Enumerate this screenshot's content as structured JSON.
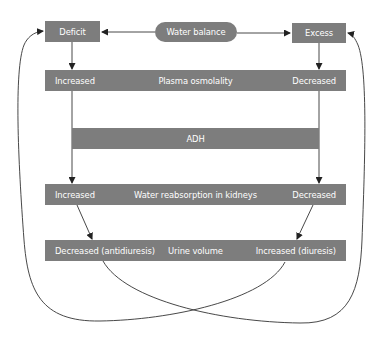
{
  "diagram": {
    "top": {
      "deficit": "Deficit",
      "water_balance": "Water balance",
      "excess": "Excess"
    },
    "rows": [
      {
        "left": "Increased",
        "center": "Plasma osmolality",
        "right": "Decreased"
      },
      {
        "left": "",
        "center": "ADH",
        "right": ""
      },
      {
        "left": "Increased",
        "center": "Water reabsorption in kidneys",
        "right": "Decreased"
      },
      {
        "left": "Decreased (antidiuresis)",
        "center": "Urine volume",
        "right": "Increased (diuresis)"
      }
    ],
    "colors": {
      "box_fill": "#7d7d7d",
      "box_text": "#ffffff",
      "line": "#333333"
    }
  }
}
